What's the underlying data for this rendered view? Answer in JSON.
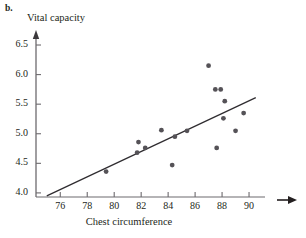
{
  "figure": {
    "panel_label": "b.",
    "y_axis_title": "Vital capacity",
    "x_axis_title": "Chest circumference"
  },
  "chart_data": {
    "type": "scatter",
    "title": "",
    "subtitle": "",
    "xlabel": "Chest circumference",
    "ylabel": "Vital capacity",
    "xlim": [
      74.2,
      92.0
    ],
    "ylim": [
      3.88,
      6.72
    ],
    "xticks": [
      76,
      78,
      80,
      82,
      84,
      86,
      88,
      90
    ],
    "yticks": [
      4.0,
      4.5,
      5.0,
      5.5,
      6.0,
      6.5
    ],
    "xtick_labels": [
      "76",
      "78",
      "80",
      "82",
      "84",
      "86",
      "88",
      "90"
    ],
    "ytick_labels": [
      "4.0",
      "4.5",
      "5.0",
      "5.5",
      "6.0",
      "6.5"
    ],
    "grid": false,
    "legend": null,
    "axis_arrows": [
      "y-up",
      "x-right"
    ],
    "points": [
      {
        "x": 79.4,
        "y": 4.36
      },
      {
        "x": 81.8,
        "y": 4.86
      },
      {
        "x": 81.7,
        "y": 4.68
      },
      {
        "x": 82.3,
        "y": 4.76
      },
      {
        "x": 83.5,
        "y": 5.06
      },
      {
        "x": 84.3,
        "y": 4.47
      },
      {
        "x": 84.5,
        "y": 4.95
      },
      {
        "x": 85.4,
        "y": 5.05
      },
      {
        "x": 87.0,
        "y": 6.15
      },
      {
        "x": 87.5,
        "y": 5.75
      },
      {
        "x": 87.9,
        "y": 5.75
      },
      {
        "x": 87.6,
        "y": 4.76
      },
      {
        "x": 88.2,
        "y": 5.55
      },
      {
        "x": 88.1,
        "y": 5.26
      },
      {
        "x": 89.0,
        "y": 5.05
      },
      {
        "x": 89.6,
        "y": 5.35
      }
    ],
    "fit_line": {
      "type": "linear-regression",
      "x_start": 75.0,
      "y_start": 3.95,
      "x_end": 90.5,
      "y_end": 5.61
    }
  }
}
